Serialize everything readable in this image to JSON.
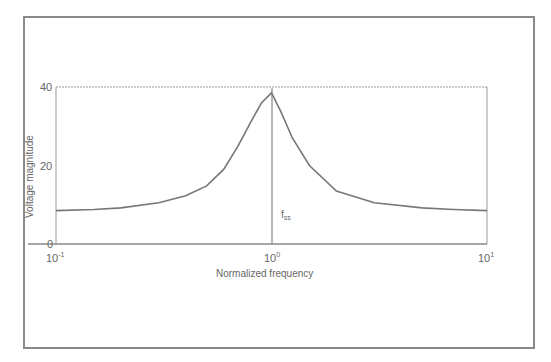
{
  "chart_data": {
    "type": "line",
    "title": "",
    "xlabel": "Normalized frequency",
    "ylabel": "Voltage magnitude",
    "xscale": "log",
    "xlim": [
      0.1,
      10
    ],
    "ylim": [
      0,
      40
    ],
    "xticks": [
      "10^-1",
      "10^0",
      "10^1"
    ],
    "yticks": [
      "0",
      "20",
      "40"
    ],
    "grid": false,
    "legend": null,
    "annotations": [
      {
        "text": "f_ss",
        "x": 1.0,
        "y": 8,
        "note": "vertical line marking resonance at normalized frequency 1"
      }
    ],
    "series": [
      {
        "name": "Voltage magnitude",
        "x": [
          0.1,
          0.15,
          0.2,
          0.3,
          0.4,
          0.5,
          0.6,
          0.7,
          0.8,
          0.9,
          1.0,
          1.1,
          1.25,
          1.5,
          2.0,
          3.0,
          5.0,
          7.0,
          10.0
        ],
        "values": [
          8.5,
          8.8,
          9.2,
          10.5,
          12.3,
          14.8,
          19,
          25,
          31,
          36,
          38.5,
          34,
          27,
          20,
          13.5,
          10.5,
          9.2,
          8.8,
          8.5
        ]
      }
    ]
  }
}
